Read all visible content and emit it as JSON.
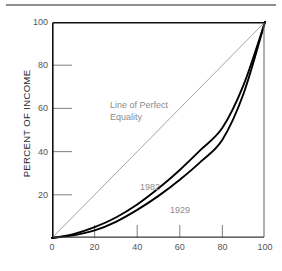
{
  "figure": {
    "y_axis_title": "PERCENT OF INCOME",
    "annotations": {
      "equality_line_label": "Line of Perfect\nEquality",
      "series_1982_label": "1982",
      "series_1929_label": "1929"
    }
  },
  "colors": {
    "curve": "#000000",
    "equality_line": "#9a9a9a",
    "tick": "#8a8a8a",
    "annotation_text": "#8c8c8c",
    "tick_label": "#555555",
    "frame_dark": "#111111",
    "frame_light": "#6f6f6f",
    "top_rule": "#8e8e8e",
    "background": "#ffffff"
  },
  "chart_data": {
    "type": "line",
    "title": "",
    "subtitle": "",
    "xlabel": "",
    "ylabel": "PERCENT OF INCOME",
    "xlim": [
      0,
      100
    ],
    "ylim": [
      0,
      100
    ],
    "grid": false,
    "legend": "inline-annotations",
    "xticks": [
      0,
      20,
      40,
      60,
      80,
      100
    ],
    "yticks": [
      0,
      20,
      40,
      60,
      80,
      100
    ],
    "xticklabels": [
      "0",
      "20",
      "40",
      "60",
      "80",
      "100"
    ],
    "yticklabels": [
      "0",
      "20",
      "40",
      "60",
      "80",
      "100"
    ],
    "annotations": [
      {
        "text": "Line of Perfect Equality",
        "x": 22,
        "y": 67
      },
      {
        "text": "1982",
        "x": 38,
        "y": 28
      },
      {
        "text": "1929",
        "x": 52,
        "y": 18
      }
    ],
    "series": [
      {
        "name": "Line of Perfect Equality",
        "style": "thin-gray",
        "x": [
          0,
          100
        ],
        "values": [
          0,
          100
        ]
      },
      {
        "name": "1982",
        "style": "thick-black",
        "x": [
          0,
          10,
          20,
          30,
          40,
          50,
          60,
          70,
          80,
          90,
          100
        ],
        "values": [
          0,
          1.8,
          5.0,
          9.5,
          15.5,
          23.0,
          31.5,
          41.0,
          51.0,
          71.0,
          100
        ]
      },
      {
        "name": "1929",
        "style": "thick-black",
        "x": [
          0,
          10,
          20,
          30,
          40,
          50,
          60,
          70,
          80,
          90,
          100
        ],
        "values": [
          0,
          1.2,
          3.5,
          7.5,
          13.0,
          19.5,
          27.0,
          35.5,
          45.5,
          67.0,
          100
        ]
      }
    ]
  }
}
